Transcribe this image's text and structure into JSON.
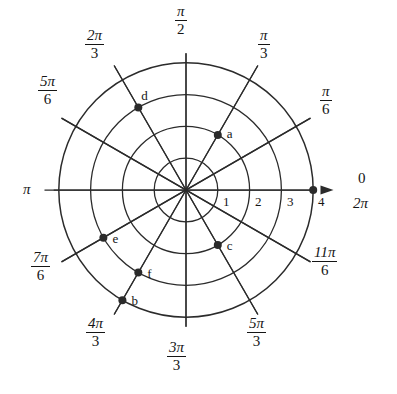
{
  "figure": {
    "center": {
      "x": 186,
      "y": 190
    },
    "unit_px": 31.8,
    "stroke_color": "#2b2b2b",
    "background": "#ffffff"
  },
  "chart_data": {
    "type": "scatter",
    "coordinate_system": "polar",
    "title": "",
    "xlabel": "",
    "ylabel": "",
    "grid": true,
    "legend": "none",
    "radial_axis": {
      "ticks": [
        1,
        2,
        3,
        4
      ],
      "tick_labels": [
        "1",
        "2",
        "3",
        "4"
      ],
      "rlim": [
        0,
        4
      ],
      "circles": [
        1,
        2,
        3,
        4
      ]
    },
    "angular_axis": {
      "spoke_count": 12,
      "spoke_step_deg": 30,
      "tick_labels": [
        {
          "text": "0",
          "angle_deg": 0,
          "radians": 0
        },
        {
          "text": "2π",
          "angle_deg": 0,
          "radians": 6.2832
        },
        {
          "num": "π",
          "den": "6",
          "angle_deg": 30,
          "radians": 0.5236
        },
        {
          "num": "π",
          "den": "3",
          "angle_deg": 60,
          "radians": 1.0472
        },
        {
          "num": "π",
          "den": "2",
          "angle_deg": 90,
          "radians": 1.5708
        },
        {
          "num": "2π",
          "den": "3",
          "angle_deg": 120,
          "radians": 2.0944
        },
        {
          "num": "5π",
          "den": "6",
          "angle_deg": 150,
          "radians": 2.618
        },
        {
          "text": "π",
          "angle_deg": 180,
          "radians": 3.1416
        },
        {
          "num": "7π",
          "den": "6",
          "angle_deg": 210,
          "radians": 3.6652
        },
        {
          "num": "4π",
          "den": "3",
          "angle_deg": 240,
          "radians": 4.1888
        },
        {
          "num": "3π",
          "den": "3",
          "angle_deg": 270,
          "radians": 4.7124
        },
        {
          "num": "5π",
          "den": "3",
          "angle_deg": 300,
          "radians": 5.236
        },
        {
          "num": "11π",
          "den": "6",
          "angle_deg": 330,
          "radians": 5.7596
        }
      ]
    },
    "points": [
      {
        "label": "a",
        "r": 2,
        "theta_deg": 60,
        "theta": "π/3",
        "label_dx": 9,
        "label_dy": -1
      },
      {
        "label": "b",
        "r": 4,
        "theta_deg": 240,
        "theta": "4π/3",
        "label_dx": 9,
        "label_dy": 1
      },
      {
        "label": "c",
        "r": 2,
        "theta_deg": 300,
        "theta": "5π/3",
        "label_dx": 9,
        "label_dy": 1
      },
      {
        "label": "d",
        "r": 3,
        "theta_deg": 120,
        "theta": "2π/3",
        "label_dx": 3,
        "label_dy": -11
      },
      {
        "label": "e",
        "r": 3,
        "theta_deg": 210,
        "theta": "7π/6",
        "label_dx": 9,
        "label_dy": 1
      },
      {
        "label": "f",
        "r": 3,
        "theta_deg": 240,
        "theta": "4π/3",
        "label_dx": 9,
        "label_dy": 1
      }
    ],
    "unlabeled_points": [
      {
        "r": 4,
        "theta_deg": 0,
        "theta": "0"
      }
    ]
  },
  "angle_labels": {
    "pi_over_2": {
      "num": "π",
      "den": "2"
    },
    "two_pi_3": {
      "num": "2π",
      "den": "3"
    },
    "pi_over_3": {
      "num": "π",
      "den": "3"
    },
    "five_pi_6": {
      "num": "5π",
      "den": "6"
    },
    "pi_over_6": {
      "num": "π",
      "den": "6"
    },
    "pi": {
      "text": "π"
    },
    "zero": {
      "text": "0"
    },
    "two_pi": {
      "text": "2π"
    },
    "seven_pi_6": {
      "num": "7π",
      "den": "6"
    },
    "eleven_pi_6": {
      "num": "11π",
      "den": "6"
    },
    "four_pi_3": {
      "num": "4π",
      "den": "3"
    },
    "three_pi_3": {
      "num": "3π",
      "den": "3"
    },
    "five_pi_3": {
      "num": "5π",
      "den": "3"
    }
  },
  "radial_ticks": {
    "one": "1",
    "two": "2",
    "three": "3",
    "four": "4"
  },
  "point_labels": {
    "a": "a",
    "b": "b",
    "c": "c",
    "d": "d",
    "e": "e",
    "f": "f"
  }
}
